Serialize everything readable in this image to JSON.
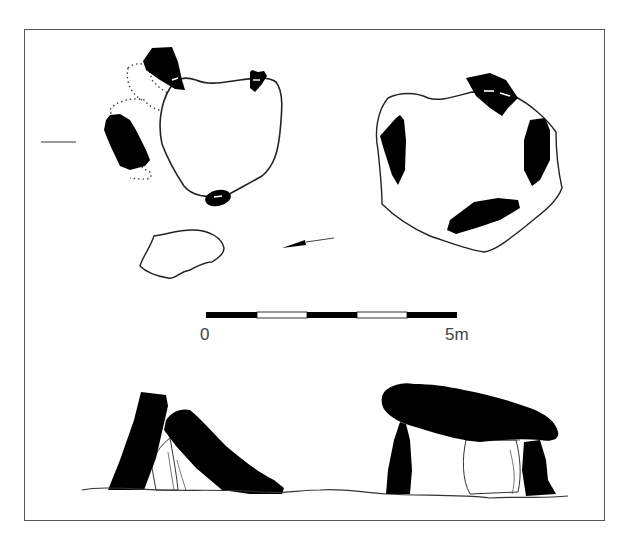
{
  "figure": {
    "type": "archaeological plan and elevation drawing",
    "plans": [
      {
        "name": "left-plan",
        "stones": 4,
        "features": [
          "irregular chamber outline",
          "dotted outline of displaced stones",
          "small separate slab outline"
        ]
      },
      {
        "name": "right-plan",
        "stones": 5,
        "features": [
          "irregular cairn outline",
          "capstone marked with dashed line"
        ]
      }
    ],
    "elevations": [
      {
        "name": "left-elevation",
        "description": "leaning upright and fallen capstone"
      },
      {
        "name": "right-elevation",
        "description": "capstone resting on two uprights with backstone"
      }
    ],
    "north_arrow": {
      "direction": "pointing left-down"
    },
    "scale_bar": {
      "start_label": "0",
      "end_label": "5m",
      "segments": 5,
      "segment_colors": [
        "#000000",
        "#ffffff",
        "#000000",
        "#ffffff",
        "#000000"
      ]
    }
  },
  "colors": {
    "ink": "#000000",
    "outline": "#222222",
    "frame": "#555555",
    "label": "#444444",
    "background": "#ffffff"
  }
}
